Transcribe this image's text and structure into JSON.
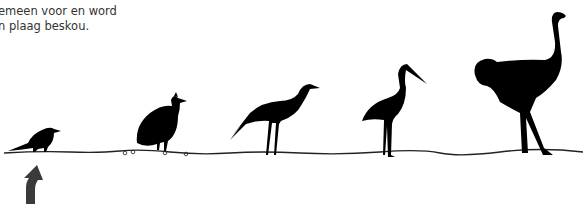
{
  "caption": {
    "line1": "emeen voor en word",
    "line2": "n plaag beskou."
  },
  "illustration": {
    "description": "Silhouettes of birds in ascending size standing on a ground line",
    "birds": [
      {
        "label": "crow",
        "icon": "crow-icon"
      },
      {
        "label": "guineafowl",
        "icon": "guineafowl-icon"
      },
      {
        "label": "crowned plover",
        "icon": "plover-icon"
      },
      {
        "label": "stork",
        "icon": "stork-icon"
      },
      {
        "label": "ostrich",
        "icon": "ostrich-icon"
      }
    ],
    "pointer": {
      "icon": "up-arrow-icon",
      "target": "crow",
      "color": "#3a3a3a"
    },
    "silhouette_color": "#000000"
  }
}
